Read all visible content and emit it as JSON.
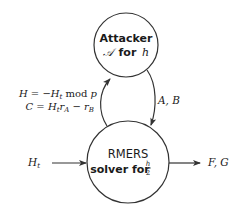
{
  "diagram": {
    "nodes": [
      {
        "id": "attacker",
        "line1": "Attacker",
        "line2_math": "𝒜",
        "line2_text": "for",
        "line2_var": "h"
      },
      {
        "id": "rmers",
        "line1": "RMERS",
        "line2_text": "solver for",
        "frac_num": "h",
        "frac_den": "2"
      }
    ],
    "edges": [
      {
        "id": "rmers-to-attacker",
        "label_line1": {
          "lhs": "H",
          "eq": " = −",
          "var": "H",
          "sub": "t",
          "rest": " mod ",
          "mod": "p"
        },
        "label_line2": {
          "lhs": "C",
          "eq": " = ",
          "v1": "H",
          "s1": "t",
          "v2": "r",
          "s2": "A",
          "minus": " − ",
          "v3": "r",
          "s3": "B"
        }
      },
      {
        "id": "attacker-to-rmers",
        "label": "A, B"
      },
      {
        "id": "input",
        "label_var": "H",
        "label_sub": "t"
      },
      {
        "id": "output",
        "label": "F, G"
      }
    ]
  },
  "colors": {
    "stroke": "#333333",
    "text": "#1a1a1a",
    "background": "#ffffff"
  }
}
